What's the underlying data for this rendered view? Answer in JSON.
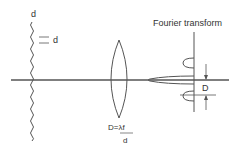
{
  "diagram": {
    "title_label": "Fourier transform",
    "grating_label": "d",
    "spacing_label": "d",
    "lens_formula_numerator": "D=λf",
    "lens_formula_denominator": "d",
    "spot_label": "D",
    "colors": {
      "stroke": "#555555",
      "text": "#333333",
      "background": "#ffffff"
    }
  }
}
